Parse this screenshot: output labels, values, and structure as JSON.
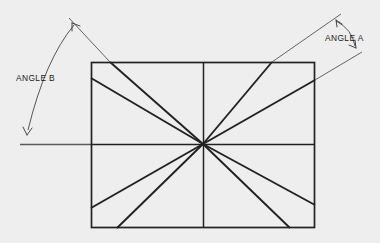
{
  "diagram": {
    "background_color": "#eeeeee",
    "line_color": "#222222",
    "labels": {
      "angle_a": "ANGLE A",
      "angle_b": "ANGLE B"
    },
    "rectangle": {
      "x": 91,
      "y": 62,
      "width": 224,
      "height": 166,
      "center_x": 203,
      "center_y": 144
    },
    "annotations": [
      {
        "name": "angle-a",
        "label": "ANGLE A",
        "label_x": 325,
        "label_y": 41,
        "arrow_upper": {
          "x": 336,
          "y": 20
        },
        "arrow_lower": {
          "x": 356,
          "y": 48
        }
      },
      {
        "name": "angle-b",
        "label": "ANGLE B",
        "label_x": 16,
        "label_y": 81,
        "arrow_upper": {
          "x": 73,
          "y": 24
        },
        "arrow_lower": {
          "x": 27,
          "y": 134
        }
      }
    ],
    "rays": [
      {
        "name": "ray-up-left-steep",
        "end_x": 110,
        "end_y": 62
      },
      {
        "name": "ray-up-left-shallow",
        "end_x": 91,
        "end_y": 78
      },
      {
        "name": "ray-up-right-steep",
        "end_x": 272,
        "end_y": 62
      },
      {
        "name": "ray-up-right-shallow",
        "end_x": 315,
        "end_y": 80
      },
      {
        "name": "ray-down-left-shallow",
        "end_x": 91,
        "end_y": 208
      },
      {
        "name": "ray-down-left-steep",
        "end_x": 117,
        "end_y": 228
      },
      {
        "name": "ray-down-right-shallow",
        "end_x": 315,
        "end_y": 205
      },
      {
        "name": "ray-down-right-steep",
        "end_x": 290,
        "end_y": 228
      }
    ],
    "axes": {
      "horizontal_label": "horizontal-center-axis",
      "vertical_label": "vertical-center-axis",
      "reference_line_label": "horizontal-reference-line"
    }
  }
}
